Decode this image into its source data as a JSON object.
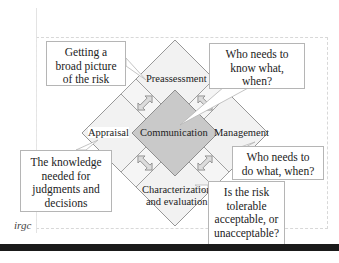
{
  "diagram": {
    "center": {
      "label": "Communication"
    },
    "phases": [
      {
        "id": "preassessment",
        "label": "Preassessment"
      },
      {
        "id": "appraisal",
        "label": "Appraisal"
      },
      {
        "id": "management",
        "label": "Management"
      },
      {
        "id": "characterization",
        "label_line1": "Characterization",
        "label_line2": "and evaluation"
      }
    ],
    "callouts": [
      {
        "id": "preassessment-note",
        "lines": [
          "Getting a",
          "broad picture",
          "of the risk"
        ]
      },
      {
        "id": "communication-note",
        "lines": [
          "Who needs to",
          "know what,",
          "when?"
        ]
      },
      {
        "id": "appraisal-note",
        "lines": [
          "The knowledge",
          "needed for",
          "judgments and",
          "decisions"
        ]
      },
      {
        "id": "management-note",
        "lines": [
          "Who needs to",
          "do what, when?"
        ]
      },
      {
        "id": "characterization-note",
        "lines": [
          "Is the risk",
          "tolerable",
          "acceptable, or",
          "unacceptable?"
        ]
      }
    ],
    "logo": "irgc",
    "colors": {
      "outer_fill": "#f2f2f2",
      "center_fill": "#c9c9c9",
      "stroke": "#7a7a7a",
      "arrow_fill": "#d9d9d9"
    }
  }
}
